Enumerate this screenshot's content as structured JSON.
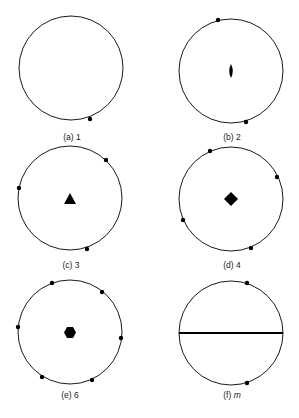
{
  "figure": {
    "panels": [
      {
        "id": "a",
        "label": "(a) 1",
        "symmetry": "1",
        "center_symbol": "none",
        "pole_count": 1
      },
      {
        "id": "b",
        "label": "(b) 2",
        "symmetry": "2",
        "center_symbol": "two-fold-lens",
        "pole_count": 2
      },
      {
        "id": "c",
        "label": "(c) 3",
        "symmetry": "3",
        "center_symbol": "triangle",
        "pole_count": 3
      },
      {
        "id": "d",
        "label": "(d) 4",
        "symmetry": "4",
        "center_symbol": "square",
        "pole_count": 4
      },
      {
        "id": "e",
        "label": "(e) 6",
        "symmetry": "6",
        "center_symbol": "hexagon",
        "pole_count": 6
      },
      {
        "id": "f",
        "label_prefix": "(f) ",
        "label_italic": "m",
        "symmetry": "m",
        "center_symbol": "mirror-line",
        "pole_count": 2
      }
    ],
    "colors": {
      "stroke": "#1a1a1a",
      "background": "#ffffff"
    }
  }
}
